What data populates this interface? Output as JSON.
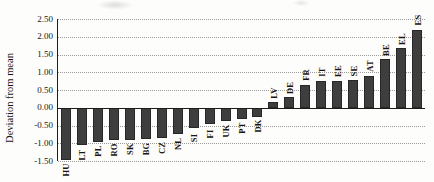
{
  "figure": {
    "background": "#fdfdfb",
    "text_color": "#161616",
    "axis_color": "#1c1c1c",
    "gridline_color": "#9b9b9b",
    "gridline_style": "dotted"
  },
  "chart_data": {
    "type": "bar",
    "title": "",
    "xlabel": "",
    "ylabel": "Deviation from mean",
    "legend": null,
    "grid": "horizontal dotted at every 0.50",
    "ylim": [
      -1.5,
      2.5
    ],
    "ytick_step": 0.5,
    "yticks": [
      "2.50",
      "2.00",
      "1.50",
      "1.00",
      "0.50",
      "0.00",
      "-0.50",
      "-1.00",
      "-1.50"
    ],
    "bar_color": "#3e3e3e",
    "label_rotation_deg": 90,
    "categories": [
      "HU",
      "LT",
      "PL",
      "RO",
      "SK",
      "BG",
      "CZ",
      "NL",
      "SI",
      "FI",
      "UK",
      "PT",
      "DK",
      "LV",
      "DE",
      "FR",
      "IT",
      "EE",
      "SE",
      "AT",
      "BE",
      "EL",
      "ES"
    ],
    "values": [
      -1.48,
      -1.06,
      -0.96,
      -0.92,
      -0.9,
      -0.89,
      -0.86,
      -0.75,
      -0.58,
      -0.46,
      -0.38,
      -0.31,
      -0.26,
      0.15,
      0.29,
      0.65,
      0.74,
      0.76,
      0.78,
      0.9,
      1.36,
      1.67,
      2.2
    ]
  }
}
